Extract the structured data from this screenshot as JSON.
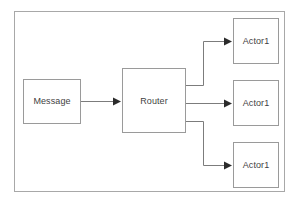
{
  "diagram": {
    "frame": {
      "name": "outer-frame",
      "x": 14,
      "y": 11,
      "width": 271,
      "height": 181,
      "stroke": "#a8a8a8",
      "fill": "#ffffff"
    },
    "style": {
      "node_stroke": "#9a9a9a",
      "node_fill": "#ffffff",
      "edge_stroke": "#7c7c7c",
      "text_color": "#3f3f3f",
      "background": "#ffffff",
      "stroke_width": 1
    },
    "nodes": [
      {
        "id": "message",
        "label": "Message",
        "x": 23,
        "y": 79,
        "width": 58,
        "height": 45
      },
      {
        "id": "router",
        "label": "Router",
        "x": 122,
        "y": 68,
        "width": 64,
        "height": 65
      },
      {
        "id": "actor-top",
        "label": "Actor1",
        "x": 233,
        "y": 18,
        "width": 46,
        "height": 46
      },
      {
        "id": "actor-middle",
        "label": "Actor1",
        "x": 233,
        "y": 80,
        "width": 46,
        "height": 46
      },
      {
        "id": "actor-bottom",
        "label": "Actor1",
        "x": 233,
        "y": 142,
        "width": 46,
        "height": 46
      }
    ],
    "edges": [
      {
        "id": "edge-message-router",
        "from": "message",
        "to": "router",
        "kind": "straight",
        "points": "81,101 119,101",
        "arrow_at": "119,101"
      },
      {
        "id": "edge-router-actor-top",
        "from": "router",
        "to": "actor-top",
        "kind": "elbow",
        "points": "186,85 203,85 203,41 230,41",
        "arrow_at": "230,41"
      },
      {
        "id": "edge-router-actor-middle",
        "from": "router",
        "to": "actor-middle",
        "kind": "straight",
        "points": "186,103 230,103",
        "arrow_at": "230,103"
      },
      {
        "id": "edge-router-actor-bottom",
        "from": "router",
        "to": "actor-bottom",
        "kind": "elbow",
        "points": "186,121 203,121 203,165 230,165",
        "arrow_at": "230,165"
      }
    ]
  }
}
